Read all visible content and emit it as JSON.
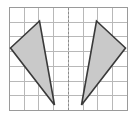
{
  "figure": {
    "background_color": "#ffffff",
    "grid": {
      "columns": 8,
      "rows": 7,
      "x0": 9.5,
      "y0": 7.5,
      "cell_width": 14.7,
      "cell_height": 14.7,
      "line_color": "#b8b8b8",
      "border_color": "#9a9a9a",
      "visible": true
    },
    "mirror_line": {
      "label": "line-of-symmetry",
      "orientation": "vertical",
      "x": 68.0,
      "y_start": 7.5,
      "y_end": 110.4,
      "color": "#8a8a8a",
      "dash": "2 2"
    },
    "shapes": [
      {
        "name": "triangle-left",
        "kind": "triangle",
        "fill": "#c9c9c9",
        "stroke": "#3a3a3a",
        "stroke_width": 1.6,
        "vertices": [
          {
            "label": "A",
            "x": 10.5,
            "y": 48.0,
            "grid": [
              0,
              3
            ]
          },
          {
            "label": "B",
            "x": 39.5,
            "y": 21.0,
            "grid": [
              2,
              1
            ]
          },
          {
            "label": "C",
            "x": 54.5,
            "y": 105.0,
            "grid": [
              3,
              7
            ]
          }
        ]
      },
      {
        "name": "triangle-right",
        "kind": "triangle",
        "fill": "#c9c9c9",
        "stroke": "#3a3a3a",
        "stroke_width": 1.6,
        "vertices": [
          {
            "label": "A'",
            "x": 125.5,
            "y": 48.0,
            "grid": [
              8,
              3
            ]
          },
          {
            "label": "B'",
            "x": 96.5,
            "y": 21.0,
            "grid": [
              6,
              1
            ]
          },
          {
            "label": "C'",
            "x": 81.5,
            "y": 105.0,
            "grid": [
              5,
              7
            ]
          }
        ]
      }
    ]
  }
}
